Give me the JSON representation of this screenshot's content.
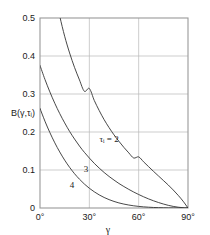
{
  "chart_data": {
    "type": "line",
    "title": "",
    "xlabel": "γ",
    "ylabel": "B(γ,τᵢ)",
    "xlim": [
      0,
      90
    ],
    "ylim": [
      0,
      0.5
    ],
    "grid": true,
    "legend_position": "inline-curve-labels",
    "x_tick_labels": [
      "0°",
      "30°",
      "60°",
      "90°"
    ],
    "x_tick_values": [
      0,
      30,
      60,
      90
    ],
    "y_tick_labels": [
      "0",
      "0.1",
      "0.2",
      "0.3",
      "0.4",
      "0.5"
    ],
    "y_tick_values": [
      0,
      0.1,
      0.2,
      0.3,
      0.4,
      0.5
    ],
    "series": [
      {
        "name": "τᵢ = 2",
        "label": "τᵢ = 2",
        "label_x": 42,
        "label_y": 0.175,
        "x": [
          0,
          3,
          6,
          9,
          12,
          15,
          18,
          21,
          24,
          27,
          30,
          33,
          36,
          39,
          42,
          45,
          48,
          51,
          54,
          57,
          60,
          63,
          66,
          69,
          72,
          75,
          78,
          81,
          84,
          87,
          90
        ],
        "y": [
          0.82,
          0.72,
          0.635,
          0.565,
          0.505,
          0.452,
          0.408,
          0.37,
          0.337,
          0.307,
          0.3145,
          0.283,
          0.2565,
          0.2325,
          0.2115,
          0.1925,
          0.1755,
          0.1595,
          0.145,
          0.1315,
          0.1345,
          0.1215,
          0.109,
          0.0965,
          0.0845,
          0.0725,
          0.0605,
          0.0475,
          0.0335,
          0.018,
          0.0
        ]
      },
      {
        "name": "3",
        "label": "3",
        "label_x": 28,
        "label_y": 0.095,
        "x": [
          0,
          3,
          6,
          9,
          12,
          15,
          18,
          21,
          24,
          27,
          30,
          33,
          36,
          39,
          42,
          45,
          48,
          51,
          54,
          57,
          60,
          63,
          66,
          69,
          72,
          75,
          78,
          81,
          84,
          87,
          90
        ],
        "y": [
          0.375,
          0.3385,
          0.3055,
          0.2755,
          0.2485,
          0.224,
          0.2015,
          0.1815,
          0.163,
          0.1465,
          0.1315,
          0.1175,
          0.105,
          0.0935,
          0.083,
          0.0735,
          0.0645,
          0.0565,
          0.049,
          0.042,
          0.0355,
          0.0295,
          0.024,
          0.019,
          0.0145,
          0.0105,
          0.007,
          0.0042,
          0.0021,
          0.0007,
          0.0
        ]
      },
      {
        "name": "4",
        "label": "4",
        "label_x": 19.5,
        "label_y": 0.052,
        "x": [
          0,
          3,
          6,
          9,
          12,
          15,
          18,
          21,
          24,
          27,
          30,
          33,
          36,
          39,
          42,
          45,
          48,
          51,
          54,
          57,
          60,
          63,
          66,
          69,
          72,
          75,
          78,
          81,
          84,
          87,
          90
        ],
        "y": [
          0.262,
          0.2285,
          0.1985,
          0.1715,
          0.1475,
          0.126,
          0.107,
          0.0903,
          0.0757,
          0.063,
          0.052,
          0.0426,
          0.0345,
          0.0277,
          0.022,
          0.0173,
          0.0134,
          0.0103,
          0.0078,
          0.0058,
          0.0042,
          0.003,
          0.0021,
          0.0014,
          0.0009,
          0.0006,
          0.0003,
          0.0002,
          0.0001,
          5e-05,
          0.0
        ]
      }
    ]
  },
  "axes": {
    "x_title": "γ",
    "y_title": "B(γ,τᵢ)"
  },
  "colors": {
    "curve": "#333333",
    "grid": "#b8b8b8",
    "frame": "#999999",
    "text": "#1a1a1a",
    "background": "#ffffff"
  }
}
